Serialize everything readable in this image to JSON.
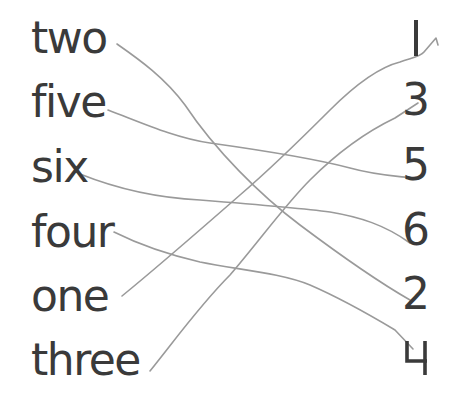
{
  "worksheet": {
    "words": [
      {
        "label": "two",
        "top": 16
      },
      {
        "label": "five",
        "top": 80
      },
      {
        "label": "six",
        "top": 145
      },
      {
        "label": "four",
        "top": 210
      },
      {
        "label": "one",
        "top": 274
      },
      {
        "label": "three",
        "top": 338
      }
    ],
    "numbers": [
      {
        "label": "1",
        "top": 16
      },
      {
        "label": "3",
        "top": 80
      },
      {
        "label": "5",
        "top": 145
      },
      {
        "label": "6",
        "top": 210
      },
      {
        "label": "2",
        "top": 274
      },
      {
        "label": "4",
        "top": 338
      }
    ],
    "matches": [
      {
        "from": "two",
        "to": "2"
      },
      {
        "from": "five",
        "to": "5"
      },
      {
        "from": "six",
        "to": "6"
      },
      {
        "from": "four",
        "to": "4"
      },
      {
        "from": "one",
        "to": "1"
      },
      {
        "from": "three",
        "to": "3"
      }
    ],
    "colors": {
      "text": "#3a3a3a",
      "pencil_line": "#9a9a9a",
      "background": "#ffffff"
    }
  }
}
